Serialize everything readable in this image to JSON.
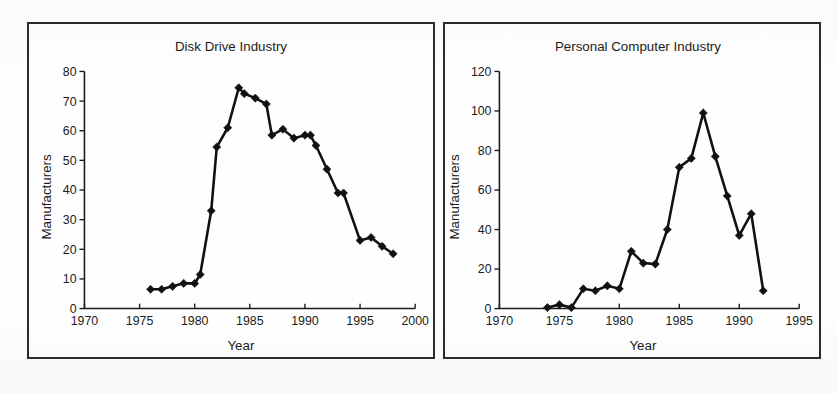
{
  "figure": {
    "background_color": "#fdfdfc",
    "ink_color": "#1c1c1c"
  },
  "panels": [
    {
      "id": "disk-drive",
      "title": "Disk Drive Industry",
      "xlabel": "Year",
      "ylabel": "Manufacturers",
      "x_ticks": [
        "1970",
        "1975",
        "1980",
        "1985",
        "1990",
        "1995",
        "2000"
      ],
      "y_ticks": [
        "0",
        "10",
        "20",
        "30",
        "40",
        "50",
        "60",
        "70",
        "80"
      ]
    },
    {
      "id": "personal-computer",
      "title": "Personal Computer Industry",
      "xlabel": "Year",
      "ylabel": "Manufacturers",
      "x_ticks": [
        "1970",
        "1975",
        "1980",
        "1985",
        "1990",
        "1995"
      ],
      "y_ticks": [
        "0",
        "20",
        "40",
        "60",
        "80",
        "100",
        "120"
      ]
    }
  ],
  "chart_data": [
    {
      "type": "line",
      "title": "Disk Drive Industry",
      "xlabel": "Year",
      "ylabel": "Manufacturers",
      "xlim": [
        1970,
        2000
      ],
      "ylim": [
        0,
        80
      ],
      "xticks": [
        1970,
        1975,
        1980,
        1985,
        1990,
        1995,
        2000
      ],
      "yticks": [
        0,
        10,
        20,
        30,
        40,
        50,
        60,
        70,
        80
      ],
      "grid": false,
      "legend": "none",
      "marker": "diamond",
      "x": [
        1976,
        1977,
        1978,
        1979,
        1980,
        1980.5,
        1981.5,
        1982,
        1983,
        1984,
        1984.5,
        1985.5,
        1986.5,
        1987,
        1988,
        1989,
        1990,
        1990.5,
        1991,
        1992,
        1993,
        1993.5,
        1995,
        1996,
        1997,
        1998
      ],
      "series": [
        {
          "name": "Disk drive manufacturers",
          "values": [
            6.5,
            6.5,
            7.5,
            8.5,
            8.5,
            11.5,
            33,
            54.5,
            61,
            74.5,
            72.5,
            71,
            69,
            58.5,
            60.5,
            57.5,
            58.5,
            58.5,
            55,
            47,
            39,
            39,
            23,
            24,
            21,
            18.5
          ]
        }
      ]
    },
    {
      "type": "line",
      "title": "Personal Computer Industry",
      "xlabel": "Year",
      "ylabel": "Manufacturers",
      "xlim": [
        1970,
        1995
      ],
      "ylim": [
        0,
        120
      ],
      "xticks": [
        1970,
        1975,
        1980,
        1985,
        1990,
        1995
      ],
      "yticks": [
        0,
        20,
        40,
        60,
        80,
        100,
        120
      ],
      "grid": false,
      "legend": "none",
      "marker": "diamond",
      "x": [
        1974,
        1975,
        1976,
        1977,
        1978,
        1979,
        1980,
        1981,
        1982,
        1983,
        1984,
        1985,
        1986,
        1987,
        1988,
        1989,
        1990,
        1991,
        1992
      ],
      "series": [
        {
          "name": "Personal computer manufacturers",
          "values": [
            0.5,
            2,
            0.5,
            10,
            9,
            11.5,
            10,
            29,
            23,
            22.5,
            40,
            71.5,
            76,
            99,
            77,
            57,
            37,
            48,
            9
          ]
        }
      ]
    }
  ]
}
